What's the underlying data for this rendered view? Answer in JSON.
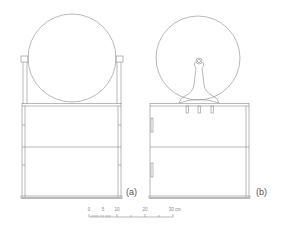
{
  "figure": {
    "panels": [
      {
        "id": "a",
        "label": "(a)",
        "description": "Mirror held in side brackets above a two-tier stand"
      },
      {
        "id": "b",
        "label": "(b)",
        "description": "Mirror back with knob/handle mounted on stand"
      }
    ],
    "scale_bar": {
      "ticks": [
        "0",
        "5",
        "10",
        "20",
        "30 cm"
      ],
      "unit": "cm"
    },
    "colors": {
      "line": "#8a8a8a",
      "background": "#ffffff",
      "text": "#555555"
    }
  }
}
